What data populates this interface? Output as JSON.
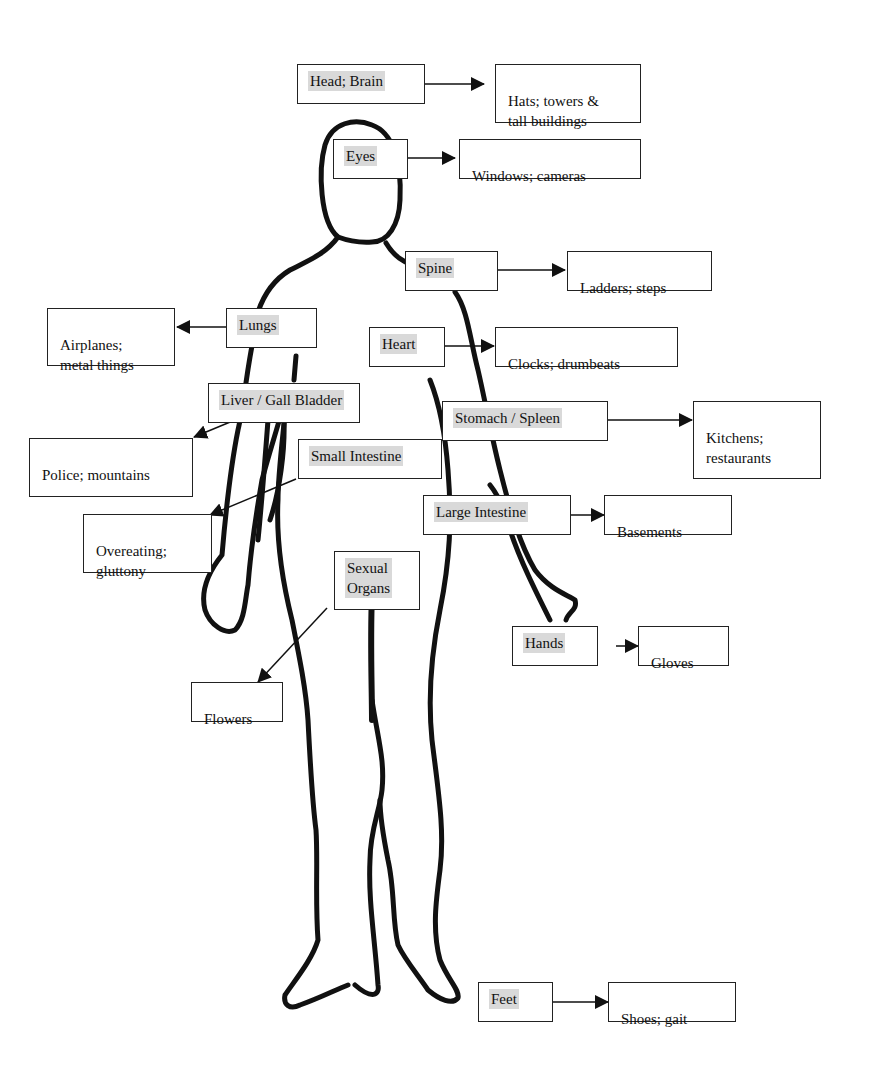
{
  "diagram": {
    "organs": [
      {
        "id": "head",
        "label": "Head; Brain",
        "association": "Hats; towers &\ntall buildings"
      },
      {
        "id": "eyes",
        "label": "Eyes",
        "association": "Windows; cameras"
      },
      {
        "id": "spine",
        "label": "Spine",
        "association": "Ladders; steps"
      },
      {
        "id": "lungs",
        "label": "Lungs",
        "association": "Airplanes;\nmetal things"
      },
      {
        "id": "heart",
        "label": "Heart",
        "association": "Clocks; drumbeats"
      },
      {
        "id": "liver",
        "label": "Liver / Gall Bladder",
        "association": "Police; mountains"
      },
      {
        "id": "stomach",
        "label": "Stomach / Spleen",
        "association": "Kitchens;\nrestaurants"
      },
      {
        "id": "small-intestine",
        "label": "Small Intestine",
        "association": "Overeating;\ngluttony"
      },
      {
        "id": "large-intestine",
        "label": "Large Intestine",
        "association": "Basements"
      },
      {
        "id": "sexual-organs",
        "label": "Sexual\nOrgans",
        "association": "Flowers"
      },
      {
        "id": "hands",
        "label": "Hands",
        "association": "Gloves"
      },
      {
        "id": "feet",
        "label": "Feet",
        "association": "Shoes; gait"
      }
    ],
    "colors": {
      "label_highlight": "#d9d9d9",
      "line": "#111111",
      "border": "#222222"
    }
  }
}
